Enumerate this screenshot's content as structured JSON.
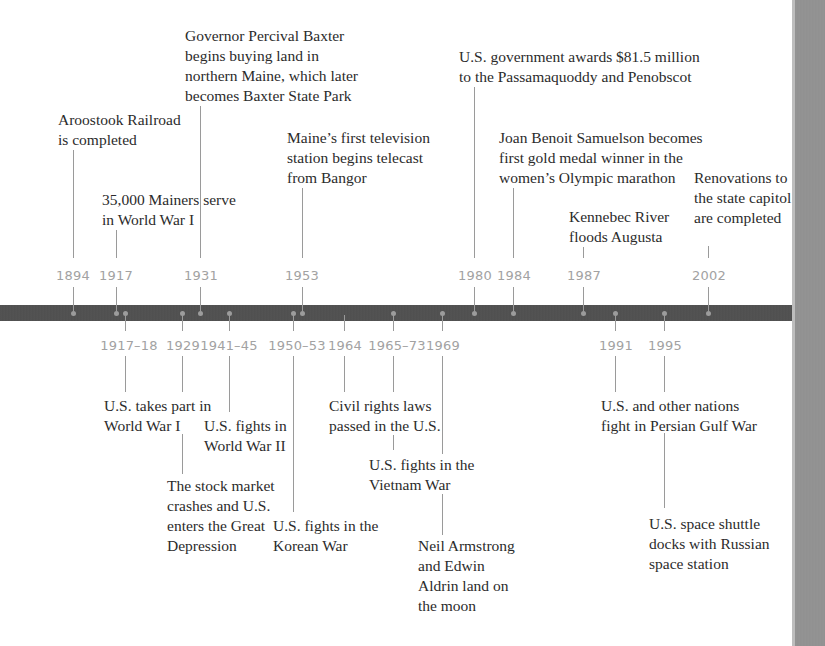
{
  "timeline": {
    "colors": {
      "bar": "#505050",
      "year_text": "#a2a2a2",
      "connector": "#9a9a9a",
      "label_text": "#2b2b2b",
      "page_edge": "#909090"
    },
    "above": [
      {
        "year": "1894",
        "lines": [
          "Aroostook Railroad",
          "is completed"
        ]
      },
      {
        "year": "1917",
        "lines": [
          "35,000 Mainers serve",
          "in World War I"
        ]
      },
      {
        "year": "1931",
        "lines": [
          "Governor Percival Baxter",
          "begins buying land in",
          "northern Maine, which later",
          "becomes Baxter State Park"
        ]
      },
      {
        "year": "1953",
        "lines": [
          "Maine’s first television",
          "station begins telecast",
          "from Bangor"
        ]
      },
      {
        "year": "1980",
        "lines": [
          "U.S. government awards $81.5 million",
          "to the Passamaquoddy and Penobscot"
        ]
      },
      {
        "year": "1984",
        "lines": [
          "Joan Benoit Samuelson becomes",
          "first gold medal winner in the",
          "women’s Olympic marathon"
        ]
      },
      {
        "year": "1987",
        "lines": [
          "Kennebec River",
          "floods Augusta"
        ]
      },
      {
        "year": "2002",
        "lines": [
          "Renovations to",
          "the state capitol",
          "are completed"
        ]
      }
    ],
    "below": [
      {
        "year": "1917–18",
        "lines": [
          "U.S. takes part in",
          "World War I"
        ]
      },
      {
        "year": "1929",
        "lines": [
          "The stock market",
          "crashes and U.S.",
          "enters the Great",
          "Depression"
        ]
      },
      {
        "year": "1941–45",
        "lines": [
          "U.S. fights in",
          "World War II"
        ]
      },
      {
        "year": "1950–53",
        "lines": [
          "U.S. fights in the",
          "Korean War"
        ]
      },
      {
        "year": "1964",
        "lines": [
          "Civil rights laws",
          "passed in the U.S."
        ]
      },
      {
        "year": "1965–73",
        "lines": [
          "U.S. fights in the",
          "Vietnam War"
        ]
      },
      {
        "year": "1969",
        "lines": [
          "Neil Armstrong",
          "and Edwin",
          "Aldrin land on",
          "the moon"
        ]
      },
      {
        "year": "1991",
        "lines": [
          "U.S. and other nations",
          "fight in Persian Gulf War"
        ]
      },
      {
        "year": "1995",
        "lines": [
          "U.S. space shuttle",
          "docks with Russian",
          "space station"
        ]
      }
    ]
  }
}
